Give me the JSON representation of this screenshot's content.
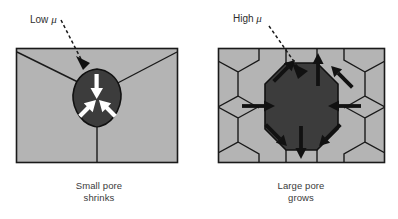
{
  "figure": {
    "title": "",
    "background_color": "#ffffff",
    "panels": [
      {
        "id": "left",
        "annotation_label": "Low ",
        "annotation_symbol": "μ",
        "caption_line1": "Small pore",
        "caption_line2": "shrinks",
        "caption": "Small pore\nshrinks",
        "grain_fill": "#b4b4b4",
        "pore_fill": "#3c3c3c",
        "outline_color": "#1a1a1a",
        "arrow_color": "#ffffff",
        "arrow_direction": "inward",
        "arrow_count": 3,
        "grain_boundary_count": 3,
        "pore_shape": "rounded-triangle",
        "pore_size": "small"
      },
      {
        "id": "right",
        "annotation_label": "High ",
        "annotation_symbol": "μ",
        "caption_line1": "Large pore",
        "caption_line2": "grows",
        "caption": "Large pore\ngrows",
        "grain_fill": "#b4b4b4",
        "pore_fill": "#3c3c3c",
        "outline_color": "#1a1a1a",
        "arrow_color": "#111111",
        "arrow_direction": "outward",
        "arrow_count": 8,
        "grain_boundary_count": 8,
        "pore_shape": "octagon",
        "pore_size": "large"
      }
    ],
    "pointer_style": "dashed-leader-with-arrowhead"
  }
}
